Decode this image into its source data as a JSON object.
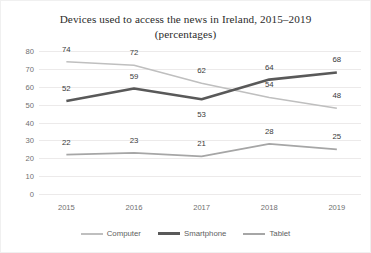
{
  "chart_data": {
    "type": "line",
    "title": "Devices used to access the news in Ireland, 2015–2019 (percentages)",
    "title_line1": "Devices used to access the news in Ireland, 2015–2019",
    "title_line2": "(percentages)",
    "xlabel": "",
    "ylabel": "",
    "categories": [
      "2015",
      "2016",
      "2017",
      "2018",
      "2019"
    ],
    "ylim": [
      0,
      80
    ],
    "yticks": [
      0,
      10,
      20,
      30,
      40,
      50,
      60,
      70,
      80
    ],
    "ytick_labels": [
      "0",
      "10",
      "20",
      "30",
      "40",
      "50",
      "60",
      "70",
      "80"
    ],
    "grid": "horizontal",
    "legend_position": "bottom-center",
    "data_labels": true,
    "series": [
      {
        "name": "Computer",
        "color": "#BFBFBF",
        "width": 1.6,
        "values": [
          74,
          72,
          62,
          54,
          48
        ],
        "label_positions": [
          "above",
          "above",
          "above",
          "above",
          "above"
        ]
      },
      {
        "name": "Smartphone",
        "color": "#595959",
        "width": 2.6,
        "values": [
          52,
          59,
          53,
          64,
          68
        ],
        "label_positions": [
          "above",
          "above",
          "below",
          "above",
          "above"
        ]
      },
      {
        "name": "Tablet",
        "color": "#A6A6A6",
        "width": 1.7,
        "values": [
          22,
          23,
          21,
          28,
          25
        ],
        "label_positions": [
          "above",
          "above",
          "above",
          "above",
          "above"
        ]
      }
    ]
  }
}
